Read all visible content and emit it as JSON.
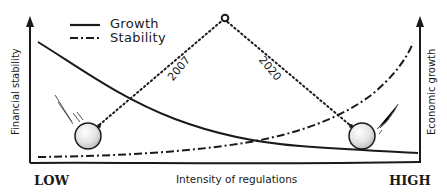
{
  "legend": {
    "items": [
      {
        "label": "Growth",
        "style": "solid"
      },
      {
        "label": "Stability",
        "style": "dash-dot"
      }
    ]
  },
  "axes": {
    "left_label": "Financial stability",
    "right_label": "Economic growth",
    "x_label": "Intensity of regulations",
    "x_low": "LOW",
    "x_high": "HIGH"
  },
  "pendulum": {
    "left_year": "2007",
    "right_year": "2020"
  },
  "colors": {
    "ink": "#1a1a1a",
    "ball_fill": "#e6e6e6",
    "background": "#ffffff"
  }
}
